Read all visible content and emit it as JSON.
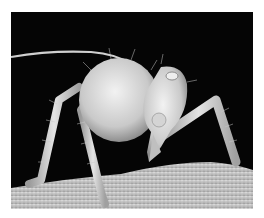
{
  "image": {
    "subject": "scanning electron micrograph of an aphid nymph on a leaf surface",
    "alt": "Greyscale SEM image of a hairy insect standing on a textured surface against a black background",
    "colors": {
      "background": "#050505",
      "insect": "#d8d8d8",
      "surface": "#cfcfcf",
      "page": "#ffffff"
    }
  }
}
